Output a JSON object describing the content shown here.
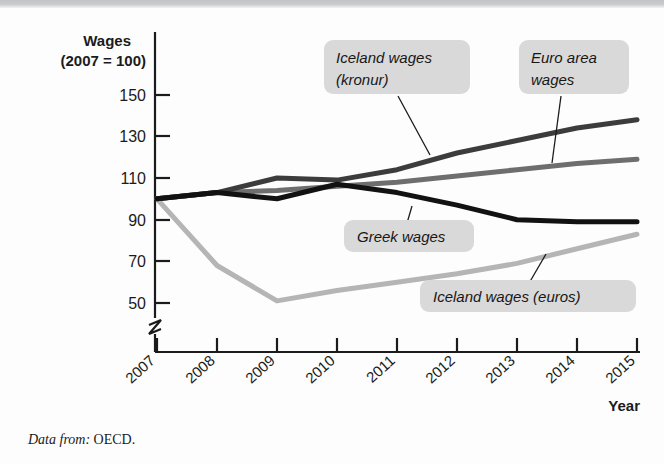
{
  "figure": {
    "source_note_label": "Data from:",
    "source_note_value": "OECD."
  },
  "chart_data": {
    "type": "line",
    "title": "",
    "ylabel_line1": "Wages",
    "ylabel_line2": "(2007 = 100)",
    "xlabel": "Year",
    "x": [
      2007,
      2008,
      2009,
      2010,
      2011,
      2012,
      2013,
      2014,
      2015
    ],
    "categories": [
      "2007",
      "2008",
      "2009",
      "2010",
      "2011",
      "2012",
      "2013",
      "2014",
      "2015"
    ],
    "yticks": [
      50,
      70,
      90,
      110,
      130,
      150
    ],
    "ytick_labels": [
      "50",
      "70",
      "90",
      "110",
      "130",
      "150"
    ],
    "ylim": [
      45,
      158
    ],
    "axis_break": true,
    "grid": false,
    "legend_position": "inline-callouts",
    "series": [
      {
        "name": "Iceland wages (kronur)",
        "color": "#3c3c3c",
        "values": [
          100,
          103,
          110,
          109,
          114,
          122,
          128,
          134,
          138
        ]
      },
      {
        "name": "Euro area wages",
        "color": "#6e6e6e",
        "values": [
          100,
          103,
          104,
          106,
          108,
          111,
          114,
          117,
          119
        ]
      },
      {
        "name": "Greek wages",
        "color": "#121212",
        "values": [
          100,
          103,
          100,
          107,
          103,
          97,
          90,
          89,
          89
        ]
      },
      {
        "name": "Iceland wages (euros)",
        "color": "#b5b5b5",
        "values": [
          100,
          68,
          51,
          56,
          60,
          64,
          69,
          76,
          83
        ]
      }
    ],
    "callouts": [
      {
        "id": "iceland-kronur",
        "line1": "Iceland wages",
        "line2": "(kronur)",
        "text": "Iceland wages (kronur)"
      },
      {
        "id": "euro-area",
        "line1": "Euro area",
        "line2": "wages",
        "text": "Euro area wages"
      },
      {
        "id": "greek",
        "line1": "Greek wages",
        "line2": "",
        "text": "Greek wages"
      },
      {
        "id": "iceland-euros",
        "line1": "Iceland wages (euros)",
        "line2": "",
        "text": "Iceland wages (euros)"
      }
    ]
  }
}
